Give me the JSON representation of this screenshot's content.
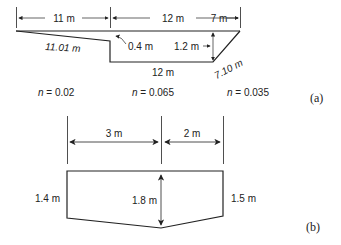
{
  "figure_a": {
    "label": "(a)",
    "top_widths": [
      "11 m",
      "12 m",
      "7 m"
    ],
    "left_slope": "11.01 m",
    "step": "0.4 m",
    "depth": "1.2 m",
    "bottom": "12 m",
    "right_slope": "7.10 m",
    "roughness": [
      {
        "symbol": "n",
        "value": " = 0.02"
      },
      {
        "symbol": "n",
        "value": " = 0.065"
      },
      {
        "symbol": "n",
        "value": " = 0.035"
      }
    ]
  },
  "figure_b": {
    "label": "(b)",
    "widths": [
      "3 m",
      "2 m"
    ],
    "left_depth": "1.4 m",
    "center_depth": "1.8 m",
    "right_depth": "1.5 m"
  }
}
